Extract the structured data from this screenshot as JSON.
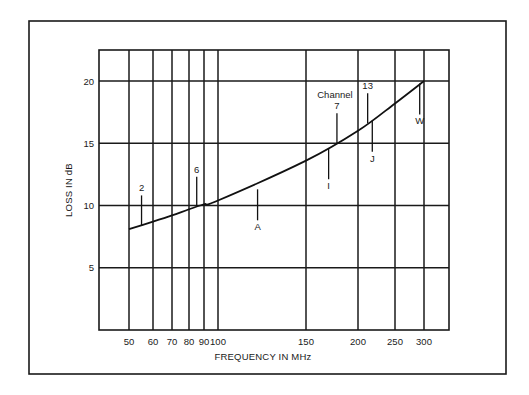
{
  "chart_data": {
    "type": "line",
    "title": "",
    "xlabel": "FREQUENCY IN MHz",
    "ylabel": "LOSS IN dB",
    "x_scale": "log",
    "xlim": [
      40,
      360
    ],
    "ylim": [
      0,
      22.5
    ],
    "grid": true,
    "legend": null,
    "x_ticks": [
      50,
      60,
      70,
      80,
      90,
      100,
      150,
      200,
      250,
      300
    ],
    "x_tick_labels": [
      "50",
      "60",
      "70",
      "80",
      "90",
      "100",
      "150",
      "200",
      "250",
      "300"
    ],
    "y_ticks": [
      5,
      10,
      15,
      20
    ],
    "y_tick_labels": [
      "5",
      "10",
      "15",
      "20"
    ],
    "series": [
      {
        "name": "Loss",
        "x": [
          50,
          60,
          70,
          80,
          90,
          100,
          150,
          200,
          250,
          300
        ],
        "y": [
          8.1,
          8.7,
          9.2,
          9.7,
          10.1,
          10.4,
          13.6,
          16.0,
          18.2,
          20.0
        ]
      }
    ],
    "annotations": [
      {
        "label": "2",
        "x": 55,
        "y": 8.4,
        "position": "above"
      },
      {
        "label": "6",
        "x": 85,
        "y": 9.9,
        "position": "above"
      },
      {
        "label": "A",
        "x": 120,
        "y": 11.3,
        "position": "below"
      },
      {
        "label": "I",
        "x": 170,
        "y": 14.6,
        "position": "below"
      },
      {
        "label": "7",
        "x": 178,
        "y": 15.0,
        "position": "above",
        "prefix": "Channel"
      },
      {
        "label": "13",
        "x": 212,
        "y": 16.6,
        "position": "above"
      },
      {
        "label": "J",
        "x": 218,
        "y": 16.8,
        "position": "below"
      },
      {
        "label": "W",
        "x": 292,
        "y": 19.8,
        "position": "below"
      }
    ]
  }
}
